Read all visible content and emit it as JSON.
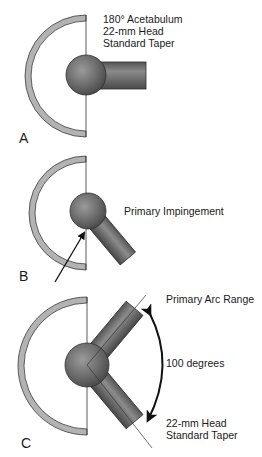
{
  "figure": {
    "panels": [
      {
        "letter": "A",
        "labels": [
          "180° Acetabulum",
          "22-mm Head",
          "Standard Taper"
        ]
      },
      {
        "letter": "B",
        "labels": [
          "Primary Impingement"
        ]
      },
      {
        "letter": "C",
        "labels": [
          "Primary Arc Range",
          "100 degrees",
          "22-mm Head",
          "Standard Taper"
        ]
      }
    ]
  },
  "colors": {
    "cup": "#b3b3b3",
    "outline": "#3a3a3a",
    "head": "#6e6e6e",
    "stem": "#5a5a5a"
  }
}
